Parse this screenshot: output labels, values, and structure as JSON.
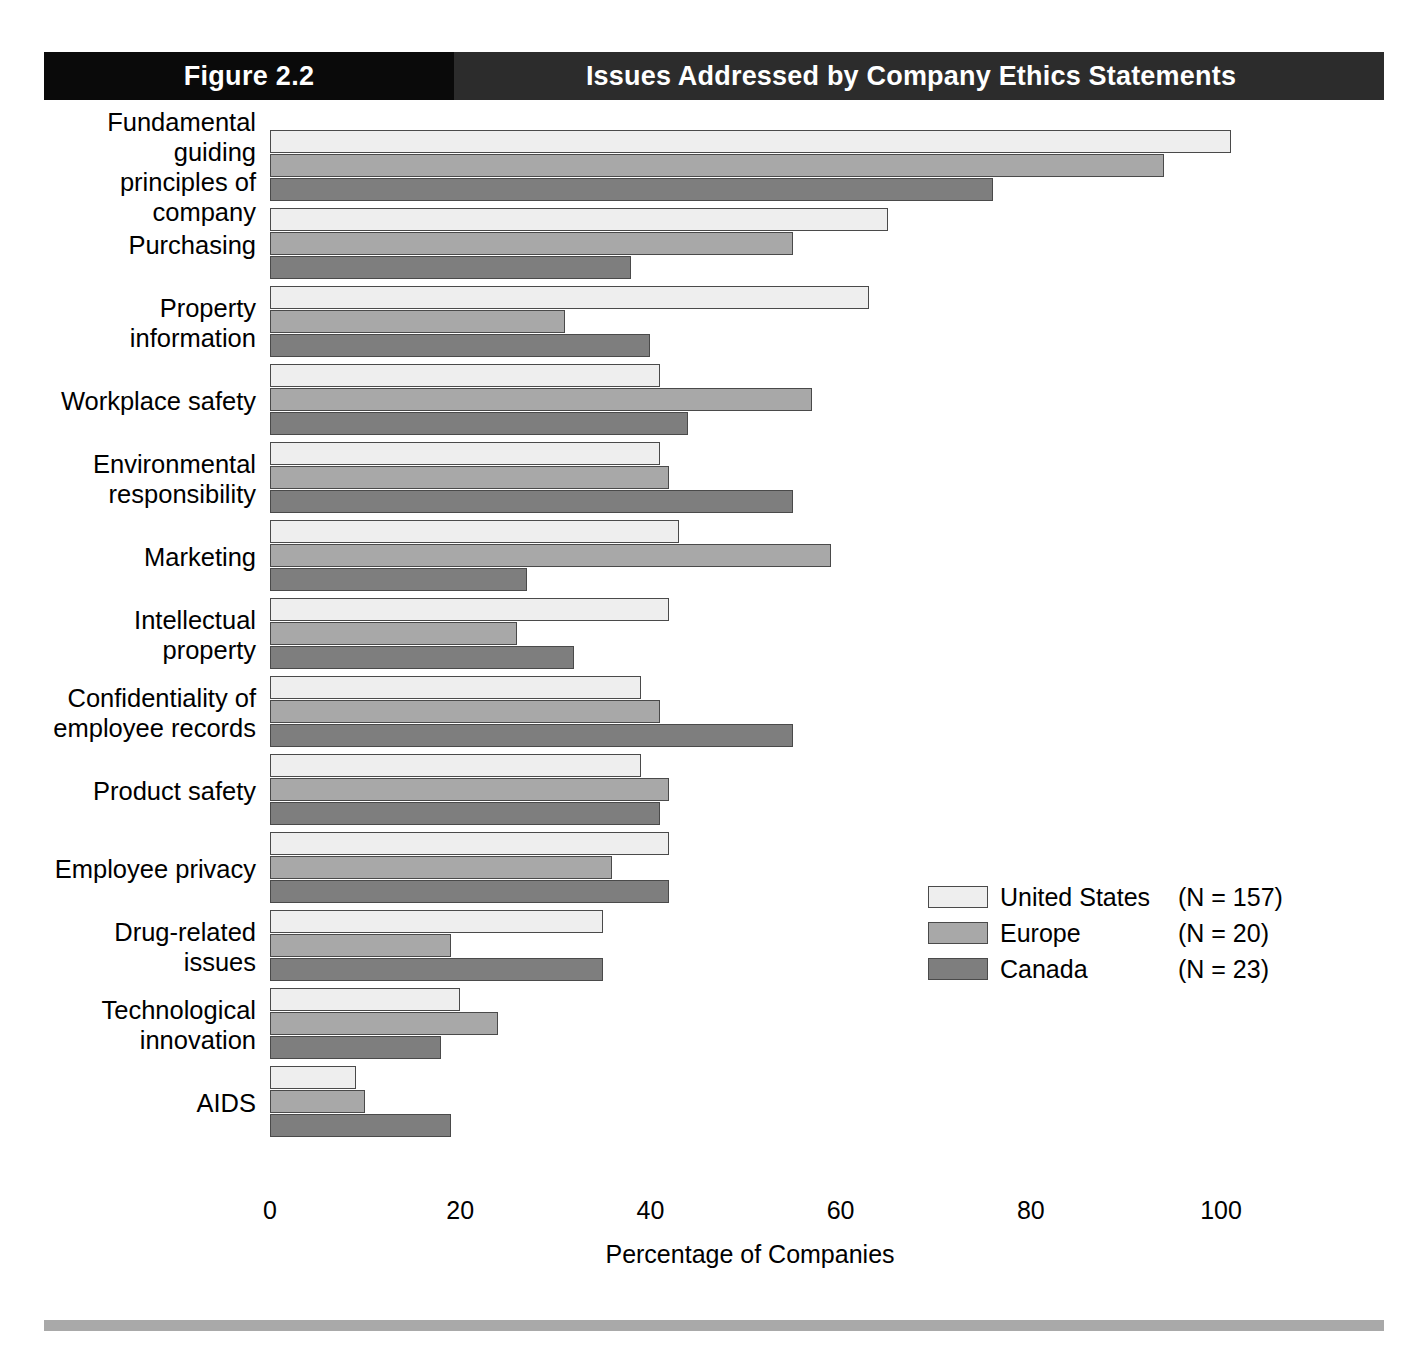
{
  "banner": {
    "figure_label": "Figure 2.2",
    "title": "Issues Addressed by Company Ethics Statements"
  },
  "legend": {
    "items": [
      {
        "name": "United States",
        "n": "(N = 157)",
        "color": "#eeeeee"
      },
      {
        "name": "Europe",
        "n": "(N = 20)",
        "color": "#a8a8a8"
      },
      {
        "name": "Canada",
        "n": "(N = 23)",
        "color": "#7e7e7e"
      }
    ]
  },
  "axis": {
    "ticks": [
      "0",
      "20",
      "40",
      "60",
      "80",
      "100"
    ],
    "xlabel": "Percentage of Companies"
  },
  "chart_data": {
    "type": "bar",
    "orientation": "horizontal",
    "title": "Issues Addressed by Company Ethics Statements",
    "xlabel": "Percentage of Companies",
    "ylabel": "",
    "xlim": [
      0,
      100
    ],
    "xticks": [
      0,
      20,
      40,
      60,
      80,
      100
    ],
    "grid": false,
    "legend_position": "middle-right",
    "categories": [
      "Fundamental guiding principles of company",
      "Purchasing",
      "Property information",
      "Workplace safety",
      "Environmental responsibility",
      "Marketing",
      "Intellectual property",
      "Confidentiality of employee records",
      "Product safety",
      "Employee privacy",
      "Drug-related issues",
      "Technological innovation",
      "AIDS"
    ],
    "category_lines": [
      [
        "Fundamental guiding",
        "principles of company"
      ],
      [
        "Purchasing"
      ],
      [
        "Property information"
      ],
      [
        "Workplace safety"
      ],
      [
        "Environmental",
        "responsibility"
      ],
      [
        "Marketing"
      ],
      [
        "Intellectual property"
      ],
      [
        "Confidentiality of",
        "employee records"
      ],
      [
        "Product safety"
      ],
      [
        "Employee privacy"
      ],
      [
        "Drug-related issues"
      ],
      [
        "Technological",
        "innovation"
      ],
      [
        "AIDS"
      ]
    ],
    "series": [
      {
        "name": "United States (N = 157)",
        "color": "#eeeeee",
        "values": [
          101,
          65,
          63,
          41,
          41,
          43,
          42,
          39,
          39,
          42,
          35,
          20,
          9
        ]
      },
      {
        "name": "Europe (N = 20)",
        "color": "#a8a8a8",
        "values": [
          94,
          55,
          31,
          57,
          42,
          59,
          26,
          41,
          42,
          36,
          19,
          24,
          10
        ]
      },
      {
        "name": "Canada (N = 23)",
        "color": "#7e7e7e",
        "values": [
          76,
          38,
          40,
          44,
          55,
          27,
          32,
          55,
          41,
          42,
          35,
          18,
          19
        ]
      }
    ]
  }
}
